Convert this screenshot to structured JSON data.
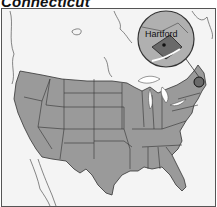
{
  "title": "Connecticut",
  "map": {
    "region": "Contiguous United States",
    "highlighted_state": "Connecticut",
    "inset": {
      "label": "Hartford",
      "marker": "capital-dot"
    },
    "colors": {
      "states_fill": "#9a9a9a",
      "highlight_fill": "#6a6a6a",
      "neighbor_land": "#f4f4f4",
      "water": "#ffffff",
      "borders": "#333333"
    }
  }
}
